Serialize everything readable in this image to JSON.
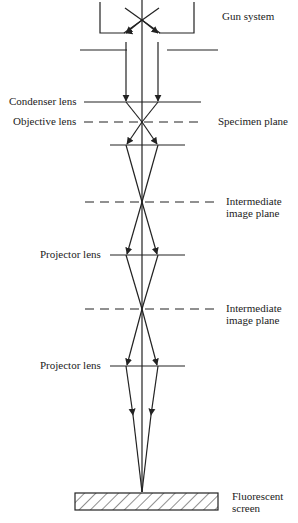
{
  "diagram": {
    "type": "transmission electron microscope ray diagram",
    "labels": {
      "gun_system": "Gun system",
      "condenser_lens": "Condenser lens",
      "objective_lens": "Objective lens",
      "specimen_plane": "Specimen plane",
      "intermediate_plane_1_line1": "Intermediate",
      "intermediate_plane_1_line2": "image plane",
      "projector_lens_1": "Projector lens",
      "intermediate_plane_2_line1": "Intermediate",
      "intermediate_plane_2_line2": "image plane",
      "projector_lens_2": "Projector lens",
      "screen_line1": "Fluorescent",
      "screen_line2": "screen"
    },
    "colors": {
      "line": "#222222",
      "background": "#ffffff"
    }
  }
}
